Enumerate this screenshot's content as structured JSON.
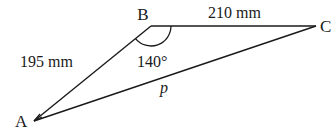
{
  "diagram": {
    "type": "triangle",
    "vertices": {
      "A": {
        "label": "A"
      },
      "B": {
        "label": "B"
      },
      "C": {
        "label": "C"
      }
    },
    "sides": {
      "AB": {
        "label": "195 mm"
      },
      "BC": {
        "label": "210 mm"
      },
      "AC": {
        "label": "p"
      }
    },
    "angles": {
      "B": {
        "label": "140°"
      }
    },
    "colors": {
      "stroke": "#1a1a1a",
      "background": "#ffffff"
    }
  }
}
